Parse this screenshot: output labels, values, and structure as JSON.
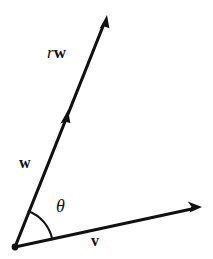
{
  "figure": {
    "kind": "vector-diagram",
    "background_color": "#ffffff",
    "stroke_color": "#111111",
    "width": 213,
    "height": 259,
    "labels": {
      "scaled_vector_scalar": "r",
      "scaled_vector_name": "w",
      "vector_w": "w",
      "vector_v": "v",
      "angle": "θ"
    },
    "geometry": {
      "origin": {
        "x": 15,
        "y": 247
      },
      "vectors": [
        {
          "name": "v",
          "from": {
            "x": 15,
            "y": 247
          },
          "to": {
            "x": 202,
            "y": 207
          },
          "arrowhead": "end",
          "angle_degrees": 12
        },
        {
          "name": "w",
          "from": {
            "x": 15,
            "y": 247
          },
          "to": {
            "x": 68,
            "y": 110
          },
          "arrowhead": "end",
          "angle_degrees": 69
        },
        {
          "name": "rw",
          "from": {
            "x": 15,
            "y": 247
          },
          "to": {
            "x": 107,
            "y": 15
          },
          "arrowhead": "end",
          "angle_degrees": 68
        }
      ],
      "angle_arc": {
        "center": {
          "x": 15,
          "y": 247
        },
        "radius": 38,
        "start_angle_degrees": 12,
        "end_angle_degrees": 69
      },
      "origin_dot_radius": 3.4
    }
  }
}
